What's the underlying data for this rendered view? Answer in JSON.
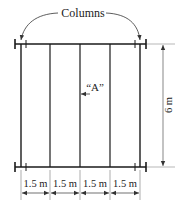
{
  "diagram": {
    "title_label": "Columns",
    "callout_label": "“A”",
    "height_dimension": "6 m",
    "spacing_dimensions": [
      "1.5 m",
      "1.5 m",
      "1.5 m",
      "1.5 m"
    ],
    "colors": {
      "line": "#1a1a1a",
      "dim_line": "#555555",
      "background": "#ffffff"
    }
  }
}
